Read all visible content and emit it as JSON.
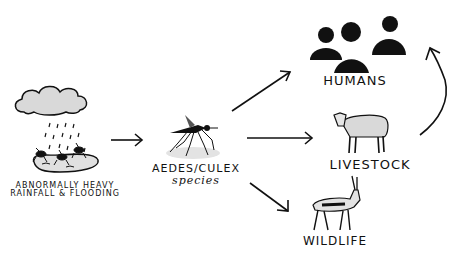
{
  "diagram": {
    "type": "transmission-flow",
    "nodes": [
      {
        "id": "source",
        "label_line1": "ABNORMALLY HEAVY",
        "label_line2": "RAINFALL & FLOODING",
        "icon": "rain-cloud-flood-mosquitoes-icon"
      },
      {
        "id": "vector",
        "label_line1": "AEDES/CULEX",
        "label_line2": "species",
        "icon": "mosquito-icon"
      },
      {
        "id": "humans",
        "label": "HUMANS",
        "icon": "people-group-icon"
      },
      {
        "id": "livestock",
        "label": "LIVESTOCK",
        "icon": "sheep-icon"
      },
      {
        "id": "wildlife",
        "label": "WILDLIFE",
        "icon": "gazelle-icon"
      }
    ],
    "edges": [
      {
        "from": "source",
        "to": "vector"
      },
      {
        "from": "vector",
        "to": "humans"
      },
      {
        "from": "vector",
        "to": "livestock"
      },
      {
        "from": "vector",
        "to": "wildlife"
      },
      {
        "from": "livestock",
        "to": "humans"
      }
    ],
    "colors": {
      "ink": "#111111",
      "fill_gray": "#d9d9d9",
      "background": "#ffffff"
    }
  }
}
